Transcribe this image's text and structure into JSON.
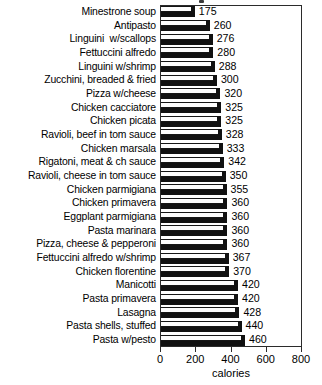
{
  "chart_data": {
    "type": "bar",
    "orientation": "horizontal",
    "title": "",
    "xlabel": "calories",
    "ylabel": "",
    "xlim": [
      0,
      800
    ],
    "xticks": [
      0,
      200,
      400,
      600,
      800
    ],
    "xtick_labels": [
      "0",
      "200",
      "400",
      "600",
      "800"
    ],
    "grid": false,
    "legend": null,
    "bar_style": "3d-shadowed",
    "categories": [
      "Minestrone soup",
      "Antipasto",
      "Linguini  w/scallops",
      "Fettuccini alfredo",
      "Linguini w/shrimp",
      "Zucchini, breaded & fried",
      "Pizza w/cheese",
      "Chicken cacciatore",
      "Chicken picata",
      "Ravioli, beef in tom sauce",
      "Chicken marsala",
      "Rigatoni, meat & ch sauce",
      "Ravioli, cheese in tom sauce",
      "Chicken parmigiana",
      "Chicken primavera",
      "Eggplant parmigiana",
      "Pasta marinara",
      "Pizza, cheese & pepperoni",
      "Fettuccini alfredo w/shrimp",
      "Chicken florentine",
      "Manicotti",
      "Pasta primavera",
      "Lasagna",
      "Pasta shells, stuffed",
      "Pasta w/pesto"
    ],
    "values": [
      175,
      260,
      276,
      280,
      288,
      300,
      320,
      325,
      325,
      328,
      333,
      342,
      350,
      355,
      360,
      360,
      360,
      360,
      367,
      370,
      420,
      420,
      428,
      440,
      460
    ],
    "value_labels": [
      "175",
      "260",
      "276",
      "280",
      "288",
      "300",
      "320",
      "325",
      "325",
      "328",
      "333",
      "342",
      "350",
      "355",
      "360",
      "360",
      "360",
      "360",
      "367",
      "370",
      "420",
      "420",
      "428",
      "440",
      "460"
    ]
  },
  "colors": {
    "bar_face": "#fdfdfd",
    "bar_shadow": "#111111",
    "outline": "#161616",
    "frame": "#2b2b2b",
    "text": "#000000",
    "background": "#ffffff"
  }
}
